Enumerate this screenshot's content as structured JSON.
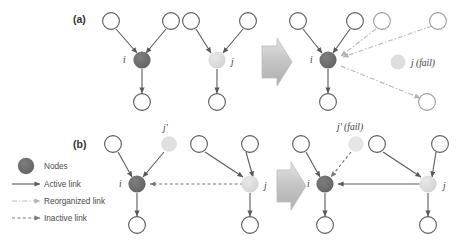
{
  "figure": {
    "background_color": "#ffffff",
    "panels": [
      {
        "id": "a",
        "label": "(a)",
        "description": "Node j fails; its incoming links are reorganized onto node i"
      },
      {
        "id": "b",
        "label": "(b)",
        "description": "Node j-prime fails; the inactive link from j to i becomes active"
      }
    ]
  },
  "labels": {
    "panel_a": "(a)",
    "panel_b": "(b)",
    "node_i": "i",
    "node_j": "j",
    "node_j_prime": "j′",
    "node_j_fail": "j (fail)",
    "node_j_prime_fail": "j′ (fail)"
  },
  "legend": {
    "items": [
      {
        "marker": "filled-circle",
        "label": "Nodes"
      },
      {
        "marker": "solid-arrow",
        "label": "Active link"
      },
      {
        "marker": "dashdot-arrow",
        "label": "Reorganized link"
      },
      {
        "marker": "dashed-arrow",
        "label": "Inactive link"
      }
    ]
  },
  "colors": {
    "node_dark": "#6b6b6b",
    "node_light": "#d9d9d9",
    "node_empty_stroke": "#5a5a5a",
    "link_active": "#5a5a5a",
    "link_reorganized": "#b9b9b9",
    "link_inactive": "#7a7a7a",
    "block_arrow_fill": "#c9c9c9",
    "text": "#3a3a3a"
  }
}
